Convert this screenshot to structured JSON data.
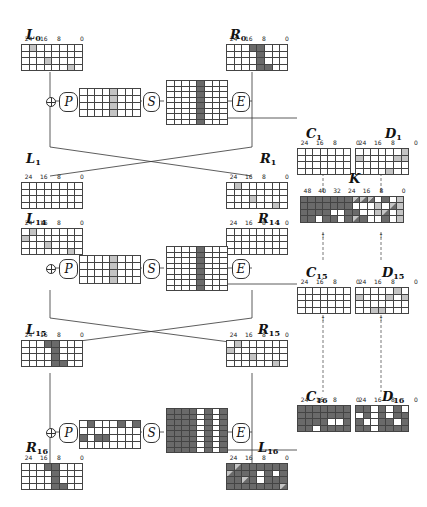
{
  "diagram": {
    "tick_labels_32": [
      "24",
      "16",
      "8",
      "0"
    ],
    "tick_labels_56": [
      "48",
      "40",
      "32",
      "24",
      "16",
      "8",
      "0"
    ],
    "operators": {
      "permutation": "P",
      "substitution": "S",
      "expansion": "E",
      "xor": "⊕"
    },
    "colors": {
      "dark": "#6a6a6a",
      "light": "#c4c4c4",
      "empty": "#ffffff",
      "line": "#444444"
    },
    "labels": {
      "L0": {
        "base": "L",
        "sub": "0"
      },
      "R0": {
        "base": "R",
        "sub": "0"
      },
      "L1": {
        "base": "L",
        "sub": "1"
      },
      "R1": {
        "base": "R",
        "sub": "1"
      },
      "L14": {
        "base": "L",
        "sub": "14"
      },
      "R14": {
        "base": "R",
        "sub": "14"
      },
      "L15": {
        "base": "L",
        "sub": "15"
      },
      "R15": {
        "base": "R",
        "sub": "15"
      },
      "R16": {
        "base": "R",
        "sub": "16"
      },
      "L16": {
        "base": "L",
        "sub": "16"
      },
      "C1": {
        "base": "C",
        "sub": "1"
      },
      "D1": {
        "base": "D",
        "sub": "1"
      },
      "C15": {
        "base": "C",
        "sub": "15"
      },
      "D15": {
        "base": "D",
        "sub": "15"
      },
      "C16": {
        "base": "C",
        "sub": "16"
      },
      "D16": {
        "base": "D",
        "sub": "16"
      },
      "K": {
        "base": "K",
        "sub": ""
      }
    }
  }
}
